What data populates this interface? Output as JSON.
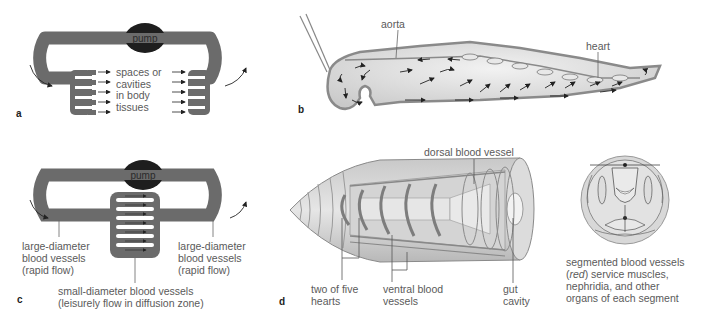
{
  "panels": {
    "a": {
      "letter": "a",
      "pump_label": "pump",
      "label": "spaces or\ncavities\nin body\ntissues"
    },
    "b": {
      "letter": "b",
      "labels": {
        "aorta": "aorta",
        "heart": "heart"
      }
    },
    "c": {
      "letter": "c",
      "pump_label": "pump",
      "left_label": "large-diameter\nblood vessels\n(rapid flow)",
      "right_label": "large-diameter\nblood vessels\n(rapid flow)",
      "bottom_label": "small-diameter blood vessels\n(leisurely flow in diffusion zone)"
    },
    "d": {
      "letter": "d",
      "labels": {
        "dorsal": "dorsal blood vessel",
        "hearts": "two of five\nhearts",
        "ventral": "ventral blood\nvessels",
        "gut": "gut\ncavity"
      }
    },
    "cross_section": {
      "caption_pre": "segmented blood vessels\n(",
      "caption_italic": "red",
      "caption_post": ") service muscles,\nnephridia, and other\norgans of each segment"
    }
  },
  "colors": {
    "vessel": "#6b6b6b",
    "pump": "#1e1e1e",
    "body_fill": "#d9d9d9",
    "outline": "#8a8a8a"
  }
}
